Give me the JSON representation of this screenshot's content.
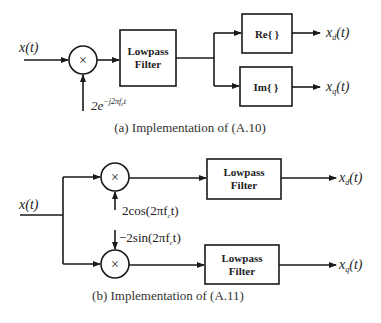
{
  "diagram_a": {
    "input_label": "x(t)",
    "multiplier_symbol": "×",
    "carrier_label_base": "2e",
    "carrier_label_exp": "−j2πf",
    "carrier_label_exp_sub": "c",
    "carrier_label_exp_tail": "t",
    "filter_line1": "Lowpass",
    "filter_line2": "Filter",
    "re_block": "Re{ }",
    "im_block": "Im{ }",
    "output_d_base": "x",
    "output_d_sub": "d",
    "output_d_tail": "(t)",
    "output_q_base": "x",
    "output_q_sub": "q",
    "output_q_tail": "(t)",
    "caption": "(a) Implementation of (A.10)"
  },
  "diagram_b": {
    "input_label": "x(t)",
    "multiplier_symbol": "×",
    "cos_label_pre": "2cos(2πf",
    "cos_label_sub": "c",
    "cos_label_post": "t)",
    "sin_label_pre": "−2sin(2πf",
    "sin_label_sub": "c",
    "sin_label_post": "t)",
    "filter_line1": "Lowpass",
    "filter_line2": "Filter",
    "output_d_base": "x",
    "output_d_sub": "d",
    "output_d_tail": "(t)",
    "output_q_base": "x",
    "output_q_sub": "q",
    "output_q_tail": "(t)",
    "caption": "(b) Implementation of (A.11)"
  },
  "colors": {
    "stroke": "#1a1a1a",
    "background": "#ffffff"
  }
}
